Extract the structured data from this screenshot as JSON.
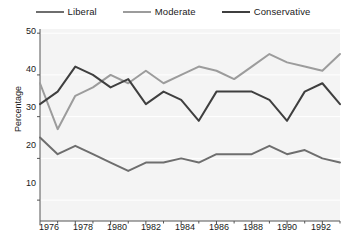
{
  "legend": {
    "position": "top",
    "items": [
      {
        "label": "Liberal",
        "color": "#6e6e6e",
        "icon": "line-swatch-icon"
      },
      {
        "label": "Moderate",
        "color": "#9c9c9c",
        "icon": "line-swatch-icon"
      },
      {
        "label": "Conservative",
        "color": "#3f3f3f",
        "icon": "line-swatch-icon"
      }
    ]
  },
  "axes": {
    "ylabel": "Percentage",
    "xlabel": "",
    "yticks": [
      "10",
      "20",
      "30",
      "40",
      "50"
    ],
    "xticks": [
      "1976",
      "1978",
      "1980",
      "1982",
      "1984",
      "1986",
      "1988",
      "1990",
      "1992"
    ]
  },
  "colors": {
    "liberal": "#6e6e6e",
    "moderate": "#9c9c9c",
    "conservative": "#3f3f3f",
    "plot_background": "#f4f4f4",
    "gridline": "#ffffff",
    "axis": "#555555",
    "text": "#1a1a1a"
  },
  "chart_data": {
    "type": "line",
    "title": "",
    "xlabel": "",
    "ylabel": "Percentage",
    "xlim": [
      1976,
      1993
    ],
    "ylim": [
      5,
      51
    ],
    "yticks": [
      10,
      20,
      30,
      40,
      50
    ],
    "xticks": [
      1976,
      1978,
      1980,
      1982,
      1984,
      1986,
      1988,
      1990,
      1992
    ],
    "grid": true,
    "legend_position": "top",
    "x": [
      1976,
      1977,
      1978,
      1979,
      1980,
      1981,
      1982,
      1983,
      1984,
      1985,
      1986,
      1987,
      1988,
      1989,
      1990,
      1991,
      1992,
      1993
    ],
    "series": [
      {
        "name": "Liberal",
        "color": "#6e6e6e",
        "values": [
          25,
          21,
          23,
          21,
          19,
          17,
          19,
          19,
          20,
          19,
          21,
          21,
          21,
          23,
          21,
          22,
          20,
          19
        ]
      },
      {
        "name": "Moderate",
        "color": "#9c9c9c",
        "values": [
          38,
          27,
          35,
          37,
          40,
          38,
          41,
          38,
          40,
          42,
          41,
          39,
          42,
          45,
          43,
          42,
          41,
          45
        ]
      },
      {
        "name": "Conservative",
        "color": "#3f3f3f",
        "values": [
          33,
          36,
          42,
          40,
          37,
          39,
          33,
          36,
          34,
          29,
          36,
          36,
          36,
          34,
          29,
          36,
          38,
          33
        ]
      }
    ]
  }
}
